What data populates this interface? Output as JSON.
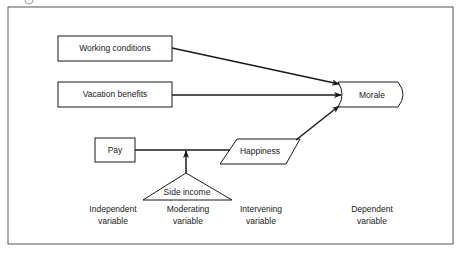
{
  "figure": {
    "frame": {
      "x": 8,
      "y": 7,
      "width": 445,
      "height": 237
    },
    "nodes": {
      "working_conditions": {
        "label": "Working conditions",
        "shape": "rectangle"
      },
      "vacation_benefits": {
        "label": "Vacation benefits",
        "shape": "rectangle"
      },
      "pay": {
        "label": "Pay",
        "shape": "rectangle"
      },
      "side_income": {
        "label": "Side income",
        "shape": "triangle"
      },
      "happiness": {
        "label": "Happiness",
        "shape": "parallelogram"
      },
      "morale": {
        "label": "Morale",
        "shape": "curved-rectangle"
      }
    },
    "edges": [
      {
        "from": "Working conditions",
        "to": "Morale",
        "arrow": true
      },
      {
        "from": "Vacation benefits",
        "to": "Morale",
        "arrow": true
      },
      {
        "from": "Pay",
        "to": "Happiness",
        "arrow": false
      },
      {
        "from": "Side income",
        "to": "Pay-Happiness link",
        "arrow": true
      },
      {
        "from": "Happiness",
        "to": "Morale",
        "arrow": true
      }
    ],
    "variable_types": [
      {
        "line1": "Independent",
        "line2": "variable"
      },
      {
        "line1": "Moderating",
        "line2": "variable"
      },
      {
        "line1": "Intervening",
        "line2": "variable"
      },
      {
        "line1": "Dependent",
        "line2": "variable"
      }
    ],
    "colors": {
      "stroke": "#1a1a1a",
      "frame": "#555555",
      "background": "#ffffff"
    }
  }
}
